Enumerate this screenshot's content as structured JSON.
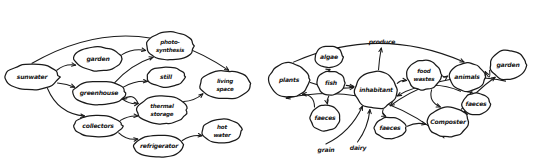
{
  "figure": {
    "title": "",
    "background": "#ffffff",
    "ink_color": "#1a1a1a",
    "style": "hand-drawn sketch",
    "panel_count": 2
  },
  "panels": [
    {
      "id": "left",
      "name": "energy-and-water-flow-diagram",
      "nodes": [
        {
          "id": "sunwater",
          "label": "sunwater",
          "line2": "",
          "cx": 32,
          "cy": 77,
          "rx": 27,
          "ry": 13
        },
        {
          "id": "garden",
          "label": "garden",
          "line2": "",
          "cx": 98,
          "cy": 59,
          "rx": 24,
          "ry": 12
        },
        {
          "id": "photosynthesis",
          "label": "photo-",
          "line2": "synthesis",
          "cx": 170,
          "cy": 46,
          "rx": 24,
          "ry": 14
        },
        {
          "id": "greenhouse",
          "label": "greenhouse",
          "line2": "",
          "cx": 99,
          "cy": 93,
          "rx": 26,
          "ry": 12
        },
        {
          "id": "still",
          "label": "still",
          "line2": "",
          "cx": 166,
          "cy": 77,
          "rx": 19,
          "ry": 10
        },
        {
          "id": "livingspace",
          "label": "living",
          "line2": "space",
          "cx": 225,
          "cy": 85,
          "rx": 26,
          "ry": 14
        },
        {
          "id": "thermalstorage",
          "label": "thermal",
          "line2": "storage",
          "cx": 162,
          "cy": 110,
          "rx": 25,
          "ry": 14
        },
        {
          "id": "collectors",
          "label": "collectors",
          "line2": "",
          "cx": 98,
          "cy": 126,
          "rx": 24,
          "ry": 11
        },
        {
          "id": "refrigerator",
          "label": "refrigerator",
          "line2": "",
          "cx": 159,
          "cy": 146,
          "rx": 25,
          "ry": 11
        },
        {
          "id": "hotwater",
          "label": "hot",
          "line2": "water",
          "cx": 222,
          "cy": 131,
          "rx": 20,
          "ry": 12
        }
      ],
      "edges": [
        {
          "from": "sunwater",
          "to": "garden"
        },
        {
          "from": "sunwater",
          "to": "greenhouse"
        },
        {
          "from": "sunwater",
          "to": "collectors"
        },
        {
          "from": "sunwater",
          "to": "livingspace"
        },
        {
          "from": "garden",
          "to": "photosynthesis"
        },
        {
          "from": "greenhouse",
          "to": "photosynthesis"
        },
        {
          "from": "greenhouse",
          "to": "still"
        },
        {
          "from": "greenhouse",
          "to": "thermalstorage"
        },
        {
          "from": "thermalstorage",
          "to": "greenhouse"
        },
        {
          "from": "thermalstorage",
          "to": "livingspace"
        },
        {
          "from": "collectors",
          "to": "thermalstorage"
        },
        {
          "from": "collectors",
          "to": "refrigerator"
        },
        {
          "from": "refrigerator",
          "to": "hotwater"
        }
      ]
    },
    {
      "id": "right",
      "name": "food-and-nutrient-cycle-diagram",
      "nodes": [
        {
          "id": "plants",
          "label": "plants",
          "line2": "",
          "cx": 289,
          "cy": 80,
          "rx": 20,
          "ry": 17
        },
        {
          "id": "algae",
          "label": "algae",
          "line2": "",
          "cx": 329,
          "cy": 57,
          "rx": 14,
          "ry": 11
        },
        {
          "id": "fish",
          "label": "fish",
          "line2": "",
          "cx": 331,
          "cy": 83,
          "rx": 14,
          "ry": 12
        },
        {
          "id": "faeces_l",
          "label": "faeces",
          "line2": "",
          "cx": 325,
          "cy": 118,
          "rx": 15,
          "ry": 13
        },
        {
          "id": "inhabitant",
          "label": "inhabitant",
          "line2": "",
          "cx": 376,
          "cy": 90,
          "rx": 21,
          "ry": 19
        },
        {
          "id": "foodwastes",
          "label": "food",
          "line2": "wastes",
          "cx": 424,
          "cy": 75,
          "rx": 17,
          "ry": 15
        },
        {
          "id": "animals",
          "label": "animals",
          "line2": "",
          "cx": 467,
          "cy": 77,
          "rx": 18,
          "ry": 14
        },
        {
          "id": "faeces_r",
          "label": "faeces",
          "line2": "",
          "cx": 476,
          "cy": 104,
          "rx": 14,
          "ry": 11
        },
        {
          "id": "composter",
          "label": "Composter",
          "line2": "",
          "cx": 448,
          "cy": 122,
          "rx": 21,
          "ry": 15
        },
        {
          "id": "faeces_b",
          "label": "faeces",
          "line2": "",
          "cx": 390,
          "cy": 128,
          "rx": 16,
          "ry": 11
        },
        {
          "id": "garden_r",
          "label": "garden",
          "line2": "",
          "cx": 508,
          "cy": 65,
          "rx": 18,
          "ry": 15
        }
      ],
      "free_labels": [
        {
          "id": "produce",
          "label": "produce",
          "x": 382,
          "y": 42
        },
        {
          "id": "grain",
          "label": "grain",
          "x": 326,
          "y": 150
        },
        {
          "id": "dairy",
          "label": "dairy",
          "x": 358,
          "y": 148
        }
      ],
      "edges": [
        {
          "from": "algae",
          "to": "fish"
        },
        {
          "from": "fish",
          "to": "inhabitant"
        },
        {
          "from": "fish",
          "to": "faeces_l"
        },
        {
          "from": "faeces_l",
          "to": "plants"
        },
        {
          "from": "plants",
          "to": "inhabitant"
        },
        {
          "from": "inhabitant",
          "to": "produce"
        },
        {
          "from": "inhabitant",
          "to": "foodwastes"
        },
        {
          "from": "foodwastes",
          "to": "animals"
        },
        {
          "from": "foodwastes",
          "to": "composter"
        },
        {
          "from": "animals",
          "to": "faeces_r"
        },
        {
          "from": "animals",
          "to": "inhabitant"
        },
        {
          "from": "faeces_r",
          "to": "composter"
        },
        {
          "from": "composter",
          "to": "garden_r"
        },
        {
          "from": "garden_r",
          "to": "animals"
        },
        {
          "from": "garden_r",
          "to": "inhabitant"
        },
        {
          "from": "faeces_b",
          "to": "composter"
        },
        {
          "from": "inhabitant",
          "to": "faeces_b"
        },
        {
          "from": "grain",
          "to": "inhabitant"
        },
        {
          "from": "dairy",
          "to": "inhabitant"
        },
        {
          "from": "composter",
          "to": "plants"
        },
        {
          "from": "plants",
          "to": "animals"
        }
      ]
    }
  ]
}
